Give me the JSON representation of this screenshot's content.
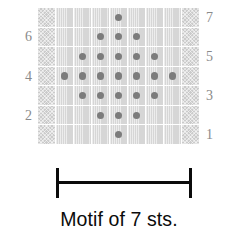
{
  "figure": {
    "caption": "Motif of 7 sts.",
    "dot_color": "#7c7c7c",
    "plain_cell_color": "#d6d6d6",
    "edge_cell_color": "#cbcbcb",
    "label_color": "#8a8a8a",
    "bracket_color": "#0b0b0b"
  },
  "labels": {
    "left": [
      {
        "row": 6,
        "text": "6"
      },
      {
        "row": 4,
        "text": "4"
      },
      {
        "row": 2,
        "text": "2"
      }
    ],
    "right": [
      {
        "row": 7,
        "text": "7"
      },
      {
        "row": 5,
        "text": "5"
      },
      {
        "row": 3,
        "text": "3"
      },
      {
        "row": 1,
        "text": "1"
      }
    ]
  },
  "chart_data": {
    "type": "heatmap",
    "title": "Motif of 7 sts.",
    "xlabel": "",
    "ylabel": "",
    "columns": 9,
    "rows": 7,
    "row_labels_right": [
      "7",
      "5",
      "3",
      "1"
    ],
    "row_labels_left": [
      "6",
      "4",
      "2"
    ],
    "legend": [],
    "grid": true,
    "cell_types": {
      "edge": "crosshatch-selvedge-stitch",
      "plain": "knit-stitch",
      "dot": "purl-stitch"
    },
    "note": "Row 1 is the bottom row; rows are numbered bottom to top. Columns 1 and 9 are selvedge (crosshatch) columns; the 7-stitch motif occupies columns 2-8.",
    "rows_data": [
      {
        "row": 7,
        "dots_columns": [
          5
        ]
      },
      {
        "row": 6,
        "dots_columns": [
          4,
          5,
          6
        ]
      },
      {
        "row": 5,
        "dots_columns": [
          3,
          4,
          5,
          6,
          7
        ]
      },
      {
        "row": 4,
        "dots_columns": [
          2,
          3,
          4,
          5,
          6,
          7,
          8
        ]
      },
      {
        "row": 3,
        "dots_columns": [
          3,
          4,
          5,
          6,
          7
        ]
      },
      {
        "row": 2,
        "dots_columns": [
          4,
          5,
          6
        ]
      },
      {
        "row": 1,
        "dots_columns": [
          5
        ]
      }
    ],
    "dot_counts_by_row_top_to_bottom": [
      1,
      3,
      5,
      7,
      5,
      3,
      1
    ]
  }
}
